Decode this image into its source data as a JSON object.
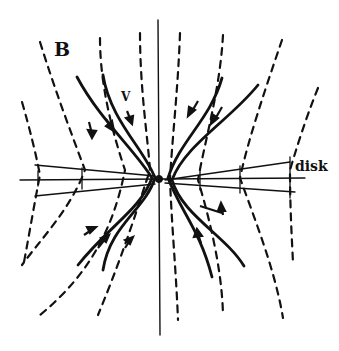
{
  "figure": {
    "panel_label": "B",
    "velocity_label": "V",
    "disk_label": "disk",
    "colors": {
      "ink": "#111111",
      "background": "#ffffff"
    }
  }
}
